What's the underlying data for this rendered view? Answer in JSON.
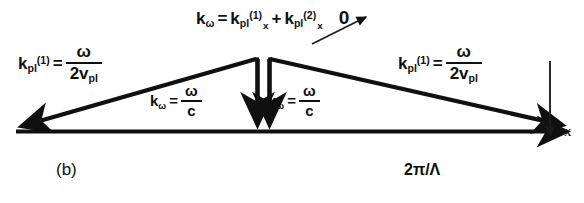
{
  "figure": {
    "panel_label": "(b)",
    "axis_label": "x",
    "grating_label": "2π/Λ",
    "background_color": "#ffffff",
    "ink_color": "#101010"
  },
  "equations": {
    "top": {
      "lhs_symbol": "k",
      "lhs_subscript": "ω",
      "equals": "=",
      "term1_symbol": "k",
      "term1_subscript": "pl",
      "term1_superscript": "(1)",
      "term1_component": "x",
      "plus": "+",
      "term2_symbol": "k",
      "term2_subscript": "pl",
      "term2_superscript": "(2)",
      "term2_component": "x",
      "term2_struck_through": true,
      "arrow_target": "0"
    },
    "left": {
      "lhs_symbol": "k",
      "lhs_subscript": "pl",
      "lhs_superscript": "(1)",
      "equals": "=",
      "numerator": "ω",
      "denominator_coeff": "2v",
      "denominator_subscript": "pl"
    },
    "right": {
      "lhs_symbol": "k",
      "lhs_subscript": "pl",
      "lhs_superscript": "(1)",
      "equals": "=",
      "numerator": "ω",
      "denominator_coeff": "2v",
      "denominator_subscript": "pl"
    },
    "center_left": {
      "lhs_symbol": "k",
      "lhs_subscript": "ω",
      "equals": "=",
      "numerator": "ω",
      "denominator": "c"
    },
    "center_right": {
      "lhs_symbol": "k",
      "lhs_subscript": "ω",
      "equals": "=",
      "numerator": "ω",
      "denominator": "c"
    }
  },
  "vectors": [
    {
      "name": "grating-vector-baseline",
      "description": "horizontal double-headed grating vector 2π/Λ",
      "x1": 12,
      "y1": 131,
      "x2": 572,
      "y2": 131
    },
    {
      "name": "plasmon-vector-left",
      "description": "left plasmon wavevector k_pl(1) pointing left-down to origin",
      "x1": 256,
      "y1": 59,
      "x2": 14,
      "y2": 128
    },
    {
      "name": "plasmon-vector-right",
      "description": "right plasmon wavevector k_pl(1) pointing right-down",
      "x1": 270,
      "y1": 59,
      "x2": 570,
      "y2": 127
    },
    {
      "name": "photon-vector-left",
      "description": "left vertical photon wavevector k_omega = omega/c",
      "x1": 257,
      "y1": 59,
      "x2": 257,
      "y2": 131
    },
    {
      "name": "photon-vector-right",
      "description": "right vertical photon wavevector k_omega = omega/c",
      "x1": 269,
      "y1": 59,
      "x2": 269,
      "y2": 131
    },
    {
      "name": "axis-arrow-x",
      "description": "depth axis arrow pointing down labelled x",
      "x1": 550,
      "y1": 60,
      "x2": 550,
      "y2": 140
    }
  ]
}
